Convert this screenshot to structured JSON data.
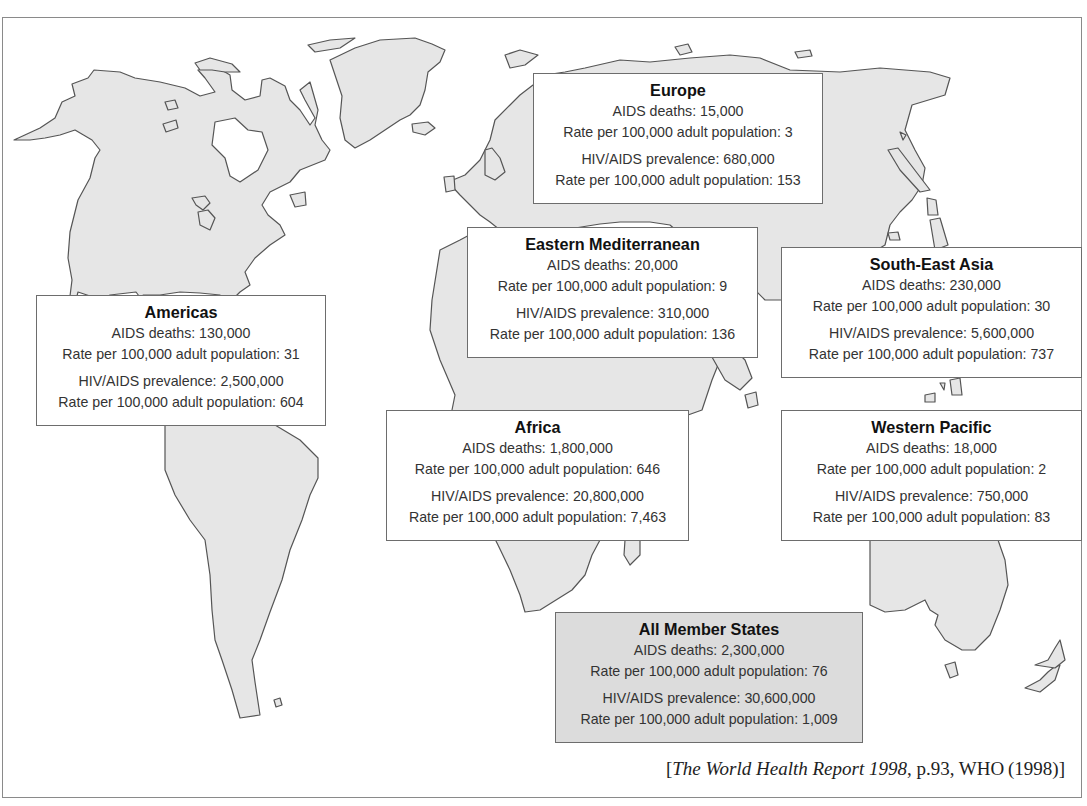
{
  "map": {
    "title": "AIDS deaths and HIV/AIDS prevalence by WHO region",
    "regions": [
      {
        "id": "europe",
        "name": "Europe",
        "aids_deaths_label": "AIDS deaths: 15,000",
        "death_rate_label": "Rate per 100,000 adult population: 3",
        "prevalence_label": "HIV/AIDS prevalence: 680,000",
        "prevalence_rate_label": "Rate per 100,000 adult population: 153"
      },
      {
        "id": "americas",
        "name": "Americas",
        "aids_deaths_label": "AIDS deaths: 130,000",
        "death_rate_label": "Rate per 100,000 adult population: 31",
        "prevalence_label": "HIV/AIDS prevalence: 2,500,000",
        "prevalence_rate_label": "Rate per 100,000 adult population: 604"
      },
      {
        "id": "eastern-mediterranean",
        "name": "Eastern Mediterranean",
        "aids_deaths_label": "AIDS deaths: 20,000",
        "death_rate_label": "Rate per 100,000 adult population: 9",
        "prevalence_label": "HIV/AIDS prevalence: 310,000",
        "prevalence_rate_label": "Rate per 100,000 adult population: 136"
      },
      {
        "id": "south-east-asia",
        "name": "South-East Asia",
        "aids_deaths_label": "AIDS deaths: 230,000",
        "death_rate_label": "Rate per 100,000 adult population: 30",
        "prevalence_label": "HIV/AIDS prevalence: 5,600,000",
        "prevalence_rate_label": "Rate per 100,000 adult population: 737"
      },
      {
        "id": "africa",
        "name": "Africa",
        "aids_deaths_label": "AIDS deaths: 1,800,000",
        "death_rate_label": "Rate per 100,000 adult population: 646",
        "prevalence_label": "HIV/AIDS prevalence: 20,800,000",
        "prevalence_rate_label": "Rate per 100,000 adult population: 7,463"
      },
      {
        "id": "western-pacific",
        "name": "Western Pacific",
        "aids_deaths_label": "AIDS deaths: 18,000",
        "death_rate_label": "Rate per 100,000 adult population: 2",
        "prevalence_label": "HIV/AIDS prevalence: 750,000",
        "prevalence_rate_label": "Rate per 100,000 adult population: 83"
      },
      {
        "id": "all-member-states",
        "name": "All Member States",
        "aids_deaths_label": "AIDS deaths: 2,300,000",
        "death_rate_label": "Rate per 100,000 adult population: 76",
        "prevalence_label": "HIV/AIDS prevalence: 30,600,000",
        "prevalence_rate_label": "Rate per 100,000 adult population: 1,009"
      }
    ],
    "data": {
      "Europe": {
        "aids_deaths": 15000,
        "death_rate_per_100k": 3,
        "prevalence": 680000,
        "prevalence_rate_per_100k": 153
      },
      "Americas": {
        "aids_deaths": 130000,
        "death_rate_per_100k": 31,
        "prevalence": 2500000,
        "prevalence_rate_per_100k": 604
      },
      "Eastern Mediterranean": {
        "aids_deaths": 20000,
        "death_rate_per_100k": 9,
        "prevalence": 310000,
        "prevalence_rate_per_100k": 136
      },
      "South-East Asia": {
        "aids_deaths": 230000,
        "death_rate_per_100k": 30,
        "prevalence": 5600000,
        "prevalence_rate_per_100k": 737
      },
      "Africa": {
        "aids_deaths": 1800000,
        "death_rate_per_100k": 646,
        "prevalence": 20800000,
        "prevalence_rate_per_100k": 7463
      },
      "Western Pacific": {
        "aids_deaths": 18000,
        "death_rate_per_100k": 2,
        "prevalence": 750000,
        "prevalence_rate_per_100k": 83
      },
      "All Member States": {
        "aids_deaths": 2300000,
        "death_rate_per_100k": 76,
        "prevalence": 30600000,
        "prevalence_rate_per_100k": 1009
      }
    },
    "colors": {
      "land": "#e6e6e6",
      "coast": "#555555",
      "box_border": "#6d6d6d",
      "total_box_fill": "#dcdcdc",
      "frame": "#8a8a8a"
    }
  },
  "citation": {
    "open_bracket": "[",
    "title_italic": "The World Health Report 1998",
    "rest": ", p.93, WHO (1998)",
    "close_bracket": "]"
  }
}
